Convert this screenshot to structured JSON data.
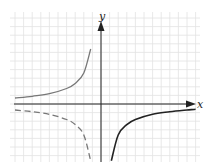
{
  "chart_data": {
    "type": "line",
    "title": "",
    "xlabel": "x",
    "ylabel": "y",
    "grid": true,
    "legend": null,
    "xlim": [
      -10.5,
      11.5
    ],
    "ylim": [
      -7,
      11
    ],
    "tick_labels": [],
    "series": [
      {
        "name": "upper-left branch",
        "style": "solid",
        "color": "#777777",
        "description": "y = 1/(-x)-type branch in quadrant II, rising toward +∞ as x→0⁻",
        "points": [
          [
            -10,
            0.7
          ],
          [
            -8,
            0.9
          ],
          [
            -6,
            1.2
          ],
          [
            -4,
            1.8
          ],
          [
            -3,
            2.4
          ],
          [
            -2,
            3.6
          ],
          [
            -1.2,
            6.4
          ]
        ]
      },
      {
        "name": "lower-left branch",
        "style": "dashed",
        "color": "#777777",
        "description": "reflection of the upper-left branch across the x-axis, in quadrant III",
        "points": [
          [
            -10,
            -0.7
          ],
          [
            -8,
            -0.9
          ],
          [
            -6,
            -1.2
          ],
          [
            -4,
            -1.8
          ],
          [
            -3,
            -2.4
          ],
          [
            -2,
            -3.6
          ],
          [
            -1.2,
            -6.6
          ]
        ]
      },
      {
        "name": "lower-right branch",
        "style": "solid",
        "color": "#222222",
        "description": "branch in quadrant IV, rising from -∞ toward 0 as x increases",
        "points": [
          [
            1.2,
            -6.6
          ],
          [
            2,
            -3.6
          ],
          [
            3,
            -2.4
          ],
          [
            4,
            -1.8
          ],
          [
            6,
            -1.2
          ],
          [
            8,
            -0.9
          ],
          [
            10,
            -0.7
          ],
          [
            11,
            -0.6
          ]
        ]
      }
    ]
  },
  "axes": {
    "x_label": "x",
    "y_label": "y"
  },
  "colors": {
    "grid": "#e2e2e2",
    "axis": "#222222",
    "left_curves": "#777777",
    "right_curve": "#222222"
  }
}
